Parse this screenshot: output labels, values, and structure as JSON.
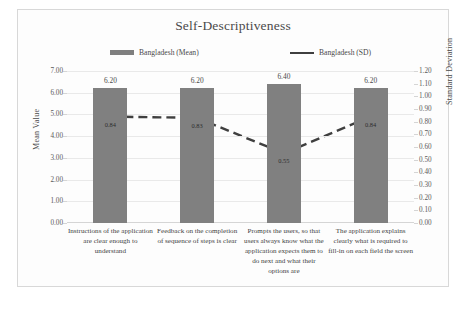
{
  "chart_data": {
    "type": "bar",
    "title": "Self-Descriptiveness",
    "categories": [
      "Instructions of the application are clear enough to understand",
      "Feedback on the completion of sequence of steps is clear",
      "Prompts the users, so that users always know what the application expects them to do next and what their options are",
      "The application explains clearly what is required to fill-in on each field the screen"
    ],
    "series": [
      {
        "name": "Bangladesh (Mean)",
        "type": "bar",
        "axis": "left",
        "values": [
          6.2,
          6.2,
          6.4,
          6.2
        ],
        "labels": [
          "6.20",
          "6.20",
          "6.40",
          "6.20"
        ],
        "color": "#808080"
      },
      {
        "name": "Bangladesh (SD)",
        "type": "line",
        "axis": "right",
        "style": "dashed",
        "values": [
          0.84,
          0.83,
          0.55,
          0.84
        ],
        "labels": [
          "0.84",
          "0.83",
          "0.55",
          "0.84"
        ],
        "color": "#3f3f3f"
      }
    ],
    "xlabel": "",
    "ylabel": "Mean Value",
    "y2label": "Standard Deviation",
    "ylim": [
      0.0,
      7.0
    ],
    "y2lim": [
      0.0,
      1.2
    ],
    "yticks": [
      "0.00",
      "1.00",
      "2.00",
      "3.00",
      "4.00",
      "5.00",
      "6.00",
      "7.00"
    ],
    "y2ticks": [
      "0.00",
      "0.10",
      "0.20",
      "0.30",
      "0.40",
      "0.50",
      "0.60",
      "0.70",
      "0.80",
      "0.90",
      "1.00",
      "1.10",
      "1.20"
    ],
    "grid": true,
    "legend_position": "top"
  },
  "legend": {
    "mean_label": "Bangladesh (Mean)",
    "sd_label": "Bangladesh (SD)"
  }
}
